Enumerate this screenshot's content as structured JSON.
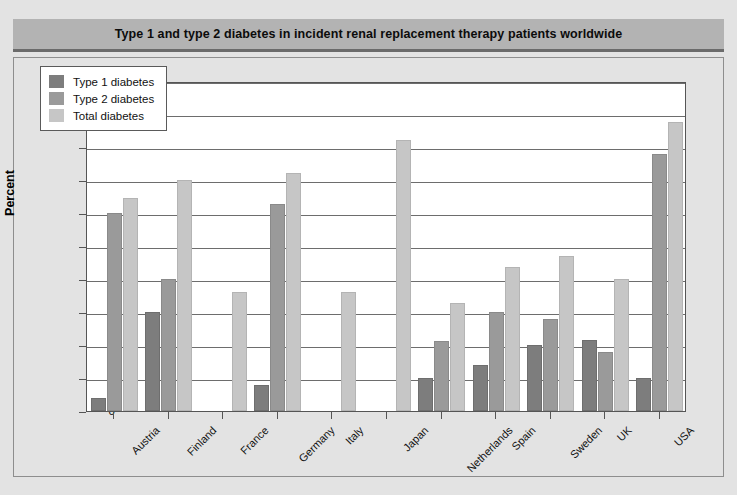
{
  "title": "Type 1 and type 2 diabetes in incident renal replacement therapy patients worldwide",
  "colors": {
    "type1": "#7d7d7d",
    "type2": "#9a9a9a",
    "total": "#c6c6c6",
    "banner": "#b3b3b3",
    "background": "#e3e3e3",
    "plot": "#ffffff",
    "grid": "#6d6d6d"
  },
  "legend": {
    "position": "top-left",
    "items": [
      {
        "label": "Type 1 diabetes",
        "color": "#7d7d7d"
      },
      {
        "label": "Type 2 diabetes",
        "color": "#9a9a9a"
      },
      {
        "label": "Total diabetes",
        "color": "#c6c6c6"
      }
    ]
  },
  "chart_data": {
    "type": "bar",
    "title": "Type 1 and type 2 diabetes in incident renal replacement therapy patients worldwide",
    "xlabel": "",
    "ylabel": "Percent",
    "ylim": [
      0,
      50
    ],
    "yticks": [
      0,
      5,
      10,
      15,
      20,
      25,
      30,
      35,
      40,
      45,
      50
    ],
    "ytick_labels": [
      "0",
      "5",
      "10",
      "15",
      "20",
      "25",
      "30",
      "35",
      "40",
      "45",
      "50"
    ],
    "grid": true,
    "legend_position": "upper left",
    "categories": [
      "Austria",
      "Finland",
      "France",
      "Germany",
      "Italy",
      "Japan",
      "Netherlands",
      "Spain",
      "Sweden",
      "UK",
      "USA"
    ],
    "series": [
      {
        "name": "Type 1 diabetes",
        "color": "#7d7d7d",
        "values": [
          2.0,
          15.0,
          null,
          4.0,
          null,
          null,
          5.0,
          7.0,
          10.0,
          10.7,
          5.0
        ]
      },
      {
        "name": "Type 2 diabetes",
        "color": "#9a9a9a",
        "values": [
          30.0,
          20.0,
          null,
          31.4,
          null,
          null,
          10.6,
          15.0,
          14.0,
          9.0,
          39.0
        ]
      },
      {
        "name": "Total diabetes",
        "color": "#c6c6c6",
        "values": [
          32.3,
          35.0,
          18.0,
          36.0,
          18.0,
          41.0,
          16.4,
          21.8,
          23.5,
          20.0,
          43.8
        ]
      }
    ]
  }
}
